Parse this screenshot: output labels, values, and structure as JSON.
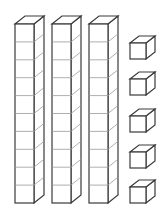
{
  "diagram": {
    "title": "",
    "tens_rods": 3,
    "unit_cubes": 5,
    "represented_value": 35,
    "colors": {
      "stroke": "#3a3a3a",
      "fill": "#ffffff",
      "inner_line": "#9a9a9a"
    }
  }
}
